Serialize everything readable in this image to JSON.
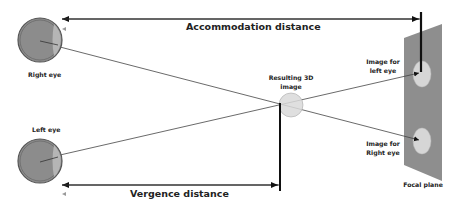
{
  "diagram": {
    "title_labels": {
      "accommodation": "Accommodation distance",
      "vergence": "Vergence distance"
    },
    "eyes": {
      "right": {
        "label": "Right eye"
      },
      "left": {
        "label": "Left eye"
      }
    },
    "resulting_image": {
      "line1": "Resulting 3D",
      "line2": "image"
    },
    "image_left": {
      "line1": "Image for",
      "line2": "left eye"
    },
    "image_right": {
      "line1": "Image for",
      "line2": "Right eye"
    },
    "focal_plane": {
      "label": "Focal plane"
    },
    "colors": {
      "eye_fill": "#8c8c8c",
      "eye_ring": "#555555",
      "lens": "#b5b5b5",
      "plane": "#8e8e8e",
      "image_fill": "#d6d6d6",
      "line": "#333333"
    }
  }
}
